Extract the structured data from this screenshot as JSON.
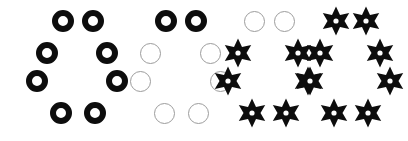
{
  "canvas": {
    "width": 408,
    "height": 141,
    "background": "#ffffff",
    "description": "Four octagonal clusters of eight shapes arranged left to right showing a gradual transformation from black rings to black six-pointed stars"
  },
  "palette": {
    "shape_black": "#0d0d0d",
    "outline_gray": "#9c9c9c",
    "background": "#ffffff"
  },
  "layout": {
    "positions_label": [
      "top-left",
      "top-right",
      "upper-left",
      "upper-right",
      "lower-left",
      "lower-right",
      "bottom-left",
      "bottom-right"
    ],
    "offsets": [
      {
        "x": 18,
        "y": 6
      },
      {
        "x": 48,
        "y": 6
      },
      {
        "x": 2,
        "y": 38
      },
      {
        "x": 62,
        "y": 38
      },
      {
        "x": -8,
        "y": 66
      },
      {
        "x": 72,
        "y": 66
      },
      {
        "x": 16,
        "y": 98
      },
      {
        "x": 50,
        "y": 98
      }
    ]
  },
  "groups": [
    {
      "name": "group-1",
      "label": "Group 1",
      "left": 30,
      "shape_counts": {
        "black_ring": 8,
        "outline_circle": 0,
        "black_star": 0
      },
      "cells": [
        {
          "position": "top-left",
          "shape": "black-ring"
        },
        {
          "position": "top-right",
          "shape": "black-ring"
        },
        {
          "position": "upper-left",
          "shape": "black-ring"
        },
        {
          "position": "upper-right",
          "shape": "black-ring"
        },
        {
          "position": "lower-left",
          "shape": "black-ring"
        },
        {
          "position": "lower-right",
          "shape": "black-ring"
        },
        {
          "position": "bottom-left",
          "shape": "black-ring"
        },
        {
          "position": "bottom-right",
          "shape": "black-ring"
        }
      ]
    },
    {
      "name": "group-2",
      "label": "Group 2",
      "left": 133,
      "shape_counts": {
        "black_ring": 2,
        "outline_circle": 6,
        "black_star": 0
      },
      "cells": [
        {
          "position": "top-left",
          "shape": "black-ring"
        },
        {
          "position": "top-right",
          "shape": "black-ring"
        },
        {
          "position": "upper-left",
          "shape": "outline-circle"
        },
        {
          "position": "upper-right",
          "shape": "outline-circle"
        },
        {
          "position": "lower-left",
          "shape": "outline-circle"
        },
        {
          "position": "lower-right",
          "shape": "outline-circle"
        },
        {
          "position": "bottom-left",
          "shape": "outline-circle"
        },
        {
          "position": "bottom-right",
          "shape": "outline-circle"
        }
      ]
    },
    {
      "name": "group-3",
      "label": "Group 3",
      "left": 221,
      "shape_counts": {
        "black_ring": 0,
        "outline_circle": 2,
        "black_star": 6
      },
      "cells": [
        {
          "position": "top-left",
          "shape": "outline-circle"
        },
        {
          "position": "top-right",
          "shape": "outline-circle"
        },
        {
          "position": "upper-left",
          "shape": "black-star"
        },
        {
          "position": "upper-right",
          "shape": "black-star"
        },
        {
          "position": "lower-left",
          "shape": "black-star"
        },
        {
          "position": "lower-right",
          "shape": "black-star"
        },
        {
          "position": "bottom-left",
          "shape": "black-star"
        },
        {
          "position": "bottom-right",
          "shape": "black-star"
        }
      ]
    },
    {
      "name": "group-4",
      "label": "Group 4",
      "left": 303,
      "shape_counts": {
        "black_ring": 0,
        "outline_circle": 0,
        "black_star": 8
      },
      "cells": [
        {
          "position": "top-left",
          "shape": "black-star"
        },
        {
          "position": "top-right",
          "shape": "black-star"
        },
        {
          "position": "upper-left",
          "shape": "black-star"
        },
        {
          "position": "upper-right",
          "shape": "black-star"
        },
        {
          "position": "lower-left",
          "shape": "black-star"
        },
        {
          "position": "lower-right",
          "shape": "black-star"
        },
        {
          "position": "bottom-left",
          "shape": "black-star"
        },
        {
          "position": "bottom-right",
          "shape": "black-star"
        }
      ]
    }
  ]
}
